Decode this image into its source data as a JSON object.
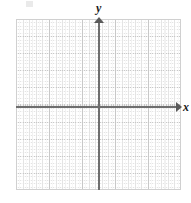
{
  "figure": {
    "kind": "blank-cartesian-coordinate-grid",
    "background_color": "#ffffff"
  },
  "axes": {
    "x_label": "x",
    "y_label": "y",
    "axis_color": "#6e6e6e",
    "arrow_color": "#5a5a5a",
    "x_arrow_direction": "right",
    "y_arrow_direction": "up"
  },
  "grid": {
    "major_line_color": "#c8c8c8",
    "minor_line_color": "#e4e4e4",
    "border_color": "#d0d0d0",
    "major_columns": 10,
    "major_rows": 10,
    "minor_per_major": 5
  },
  "chart_data": {
    "type": "scatter",
    "title": "",
    "xlabel": "x",
    "ylabel": "y",
    "xlim": [
      -5,
      5
    ],
    "ylim": [
      -5,
      5
    ],
    "xticks": [
      -5,
      -4,
      -3,
      -2,
      -1,
      0,
      1,
      2,
      3,
      4,
      5
    ],
    "yticks": [
      -5,
      -4,
      -3,
      -2,
      -1,
      0,
      1,
      2,
      3,
      4,
      5
    ],
    "xtick_labels": [
      "",
      "",
      "",
      "",
      "",
      "",
      "",
      "",
      "",
      "",
      ""
    ],
    "ytick_labels": [
      "",
      "",
      "",
      "",
      "",
      "",
      "",
      "",
      "",
      "",
      ""
    ],
    "grid": true,
    "minor_grid": true,
    "legend": false,
    "series": [],
    "annotations": [],
    "note": "Empty graph paper: coordinate plane with labeled x and y axes, no plotted data, no numeric tick labels."
  }
}
